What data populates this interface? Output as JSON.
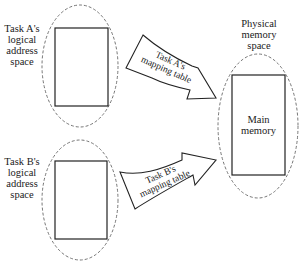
{
  "diagram": {
    "task_a": {
      "label_lines": [
        "Task A's",
        "logical",
        "address",
        "space"
      ]
    },
    "task_b": {
      "label_lines": [
        "Task B's",
        "logical",
        "address",
        "space"
      ]
    },
    "physical": {
      "label_lines": [
        "Physical",
        "memory",
        "space"
      ],
      "main_memory_lines": [
        "Main",
        "memory"
      ]
    },
    "arrow_a": {
      "label_lines": [
        "Task A's",
        "mapping table"
      ]
    },
    "arrow_b": {
      "label_lines": [
        "Task B's",
        "mapping table"
      ]
    },
    "colors": {
      "stroke": "#222222",
      "dashed": "#555555",
      "background": "#ffffff"
    }
  }
}
